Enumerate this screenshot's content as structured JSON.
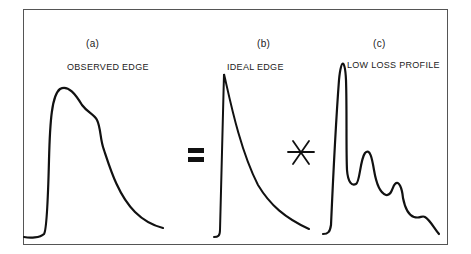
{
  "diagram": {
    "panels": [
      {
        "id": "(a)",
        "title": "OBSERVED EDGE"
      },
      {
        "id": "(b)",
        "title": "IDEAL EDGE"
      },
      {
        "id": "(c)",
        "title": "LOW LOSS PROFILE"
      }
    ],
    "operators": {
      "equals": "=",
      "convolve": "✳"
    },
    "colors": {
      "stroke": "#111111",
      "frame": "#555555",
      "background": "#ffffff"
    }
  }
}
